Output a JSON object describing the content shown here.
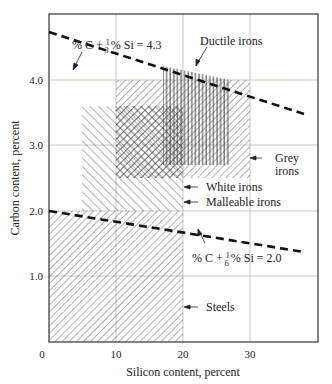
{
  "figure": {
    "title": "",
    "xlabel": "Silicon content, percent",
    "ylabel": "Carbon content, percent",
    "x_ticks": [
      {
        "value": 0,
        "label": "0"
      },
      {
        "value": 10,
        "label": "10"
      },
      {
        "value": 20,
        "label": "20"
      },
      {
        "value": 30,
        "label": "30"
      }
    ],
    "y_ticks": [
      {
        "value": 1.0,
        "label": "1.0"
      },
      {
        "value": 2.0,
        "label": "2.0"
      },
      {
        "value": 3.0,
        "label": "3.0"
      },
      {
        "value": 4.0,
        "label": "4.0"
      }
    ],
    "regions": [
      {
        "name": "Steels",
        "label": "Steels",
        "si": [
          0,
          20
        ],
        "c": [
          0,
          2.0
        ],
        "hatch": "forward-diagonal"
      },
      {
        "name": "Malleable irons",
        "label": "Malleable irons",
        "si": [
          5,
          20
        ],
        "c": [
          2.0,
          3.6
        ],
        "hatch": "back-diagonal"
      },
      {
        "name": "White irons",
        "label": "White irons",
        "si": [
          10,
          20
        ],
        "c": [
          2.5,
          3.6
        ],
        "hatch": "cross"
      },
      {
        "name": "Grey irons",
        "label_line1": "Grey",
        "label_line2": "irons",
        "si": [
          10,
          30
        ],
        "c": [
          2.5,
          4.0
        ],
        "hatch": "forward-diagonal"
      },
      {
        "name": "Ductile irons",
        "label": "Ductile irons",
        "si": [
          18,
          28
        ],
        "c": [
          2.7,
          4.2
        ],
        "hatch": "vertical"
      }
    ],
    "lines": [
      {
        "name": "CE 4.3",
        "eq_prefix": "% C + ",
        "frac_num": "1",
        "frac_den": "3",
        "eq_suffix": "% Si = 4.3",
        "from": [
          0,
          4.3
        ],
        "to": [
          38,
          3.03
        ],
        "style": "dashed"
      },
      {
        "name": "CE 2.0",
        "eq_prefix": "% C + ",
        "frac_num": "1",
        "frac_den": "6",
        "eq_suffix": "% Si = 2.0",
        "from": [
          0,
          2.0
        ],
        "to": [
          38,
          1.37
        ],
        "style": "dashed"
      }
    ]
  }
}
